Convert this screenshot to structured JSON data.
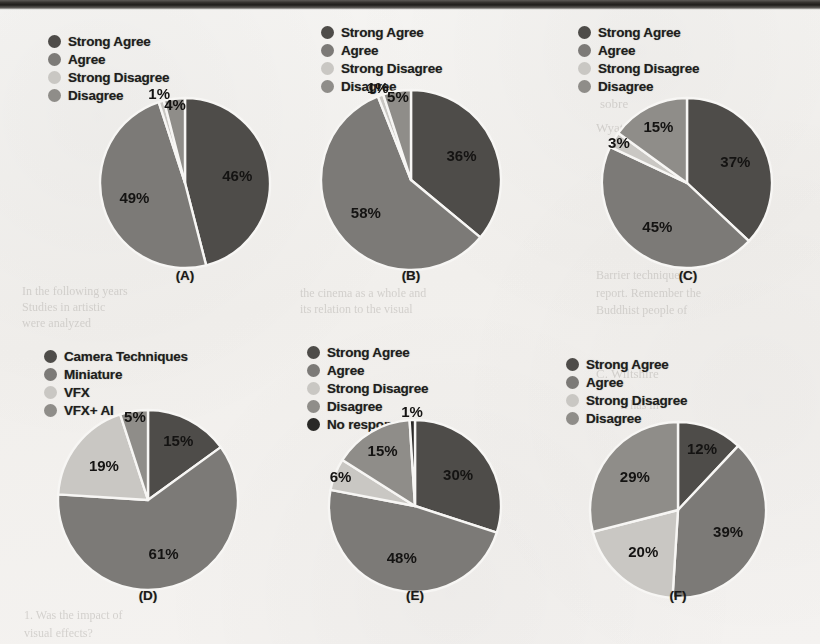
{
  "page": {
    "background_color": "#f3f2f0",
    "scan_edge_color": "#1e1c1a",
    "ghost_text": [
      {
        "text": "sobre",
        "x": 600,
        "y": 96,
        "size": 13
      },
      {
        "text": "Wyatt",
        "x": 596,
        "y": 120,
        "size": 13
      },
      {
        "text": "Barrier techniques",
        "x": 596,
        "y": 268,
        "size": 12
      },
      {
        "text": "report. Remember the",
        "x": 596,
        "y": 286,
        "size": 12
      },
      {
        "text": "Buddhist people of",
        "x": 596,
        "y": 303,
        "size": 12
      },
      {
        "text": "In the following years",
        "x": 22,
        "y": 284,
        "size": 12
      },
      {
        "text": "Studies in artistic",
        "x": 22,
        "y": 300,
        "size": 12
      },
      {
        "text": "were analyzed",
        "x": 22,
        "y": 316,
        "size": 12
      },
      {
        "text": "the cinema as a whole and",
        "x": 300,
        "y": 286,
        "size": 12
      },
      {
        "text": "its relation to the visual",
        "x": 300,
        "y": 302,
        "size": 12
      },
      {
        "text": "1. Was the impact of",
        "x": 24,
        "y": 608,
        "size": 12
      },
      {
        "text": "visual effects?",
        "x": 24,
        "y": 626,
        "size": 12
      },
      {
        "text": "C. Wiltshire",
        "x": 596,
        "y": 366,
        "size": 13
      },
      {
        "text": "It has in",
        "x": 620,
        "y": 398,
        "size": 12
      }
    ]
  },
  "palette": {
    "strong_agree": "#4e4c49",
    "agree": "#7c7a77",
    "strong_disagree": "#c9c7c3",
    "disagree": "#8f8d89",
    "no_response": "#2a2927",
    "camera_techniques": "#4e4c49",
    "miniature": "#7c7a77",
    "vfx": "#c9c7c3",
    "vfx_ai": "#8f8d89",
    "slice_divider": "#f7f6f4"
  },
  "charts": [
    {
      "id": "chart-a",
      "caption": "(A)",
      "legend": [
        {
          "label": "Strong Agree",
          "color": "#4e4c49"
        },
        {
          "label": "Agree",
          "color": "#7c7a77"
        },
        {
          "label": "Strong Disagree",
          "color": "#c9c7c3"
        },
        {
          "label": "Disagree",
          "color": "#8f8d89"
        }
      ],
      "chart_data": {
        "type": "pie",
        "title": "(A)",
        "categories": [
          "Strong Agree",
          "Agree",
          "Strong Disagree",
          "Disagree"
        ],
        "values": [
          46,
          49,
          1,
          4
        ],
        "value_labels": [
          "46%",
          "49%",
          "1%",
          "4%"
        ],
        "unit": "percent",
        "total": 100,
        "start_angle": 0,
        "legend_position": "top-left"
      }
    },
    {
      "id": "chart-b",
      "caption": "(B)",
      "legend": [
        {
          "label": "Strong Agree",
          "color": "#4e4c49"
        },
        {
          "label": "Agree",
          "color": "#7c7a77"
        },
        {
          "label": "Strong Disagree",
          "color": "#c9c7c3"
        },
        {
          "label": "Disagree",
          "color": "#8f8d89"
        }
      ],
      "chart_data": {
        "type": "pie",
        "title": "(B)",
        "categories": [
          "Strong Agree",
          "Agree",
          "Strong Disagree",
          "Disagree"
        ],
        "values": [
          36,
          58,
          1,
          5
        ],
        "value_labels": [
          "36%",
          "58%",
          "1%",
          "5%"
        ],
        "unit": "percent",
        "total": 100,
        "start_angle": 0,
        "legend_position": "top-left"
      }
    },
    {
      "id": "chart-c",
      "caption": "(C)",
      "legend": [
        {
          "label": "Strong Agree",
          "color": "#4e4c49"
        },
        {
          "label": "Agree",
          "color": "#7c7a77"
        },
        {
          "label": "Strong Disagree",
          "color": "#c9c7c3"
        },
        {
          "label": "Disagree",
          "color": "#8f8d89"
        }
      ],
      "chart_data": {
        "type": "pie",
        "title": "(C)",
        "categories": [
          "Strong Agree",
          "Agree",
          "Strong Disagree",
          "Disagree"
        ],
        "values": [
          37,
          45,
          3,
          15
        ],
        "value_labels": [
          "37%",
          "45%",
          "3%",
          "15%"
        ],
        "unit": "percent",
        "total": 100,
        "start_angle": 0,
        "legend_position": "top-left"
      }
    },
    {
      "id": "chart-d",
      "caption": "(D)",
      "legend": [
        {
          "label": "Camera Techniques",
          "color": "#4e4c49"
        },
        {
          "label": "Miniature",
          "color": "#7c7a77"
        },
        {
          "label": "VFX",
          "color": "#c9c7c3"
        },
        {
          "label": "VFX+ AI",
          "color": "#8f8d89"
        }
      ],
      "chart_data": {
        "type": "pie",
        "title": "(D)",
        "categories": [
          "Camera Techniques",
          "Miniature",
          "VFX",
          "VFX+ AI"
        ],
        "values": [
          15,
          61,
          19,
          5
        ],
        "value_labels": [
          "15%",
          "61%",
          "19%",
          "5%"
        ],
        "unit": "percent",
        "total": 100,
        "start_angle": 0,
        "legend_position": "top-left"
      }
    },
    {
      "id": "chart-e",
      "caption": "(E)",
      "legend": [
        {
          "label": "Strong Agree",
          "color": "#4e4c49"
        },
        {
          "label": "Agree",
          "color": "#7c7a77"
        },
        {
          "label": "Strong Disagree",
          "color": "#c9c7c3"
        },
        {
          "label": "Disagree",
          "color": "#8f8d89"
        },
        {
          "label": "No response",
          "color": "#2a2927"
        }
      ],
      "chart_data": {
        "type": "pie",
        "title": "(E)",
        "categories": [
          "Strong Agree",
          "Agree",
          "Strong Disagree",
          "Disagree",
          "No response"
        ],
        "values": [
          30,
          48,
          6,
          15,
          1
        ],
        "value_labels": [
          "30%",
          "48%",
          "6%",
          "15%",
          "1%"
        ],
        "unit": "percent",
        "total": 100,
        "start_angle": 0,
        "legend_position": "top-left"
      }
    },
    {
      "id": "chart-f",
      "caption": "(F)",
      "legend": [
        {
          "label": "Strong Agree",
          "color": "#4e4c49"
        },
        {
          "label": "Agree",
          "color": "#7c7a77"
        },
        {
          "label": "Strong Disagree",
          "color": "#c9c7c3"
        },
        {
          "label": "Disagree",
          "color": "#8f8d89"
        }
      ],
      "chart_data": {
        "type": "pie",
        "title": "(F)",
        "categories": [
          "Strong Agree",
          "Agree",
          "Strong Disagree",
          "Disagree"
        ],
        "values": [
          12,
          39,
          20,
          29
        ],
        "value_labels": [
          "12%",
          "39%",
          "20%",
          "29%"
        ],
        "unit": "percent",
        "total": 100,
        "start_angle": 0,
        "legend_position": "top-left"
      }
    }
  ],
  "layout": {
    "cells": [
      {
        "legend_left": 48,
        "legend_top": 33,
        "pie_left": 100,
        "pie_top": 98,
        "pie_size": 170,
        "caption_left": 155,
        "caption_top": 268
      },
      {
        "legend_left": 48,
        "legend_top": 24,
        "pie_left": 48,
        "pie_top": 90,
        "pie_size": 180,
        "caption_left": 108,
        "caption_top": 268
      },
      {
        "legend_left": 32,
        "legend_top": 24,
        "pie_left": 56,
        "pie_top": 98,
        "pie_size": 170,
        "caption_left": 112,
        "caption_top": 268
      },
      {
        "legend_left": 44,
        "legend_top": 26,
        "pie_left": 58,
        "pie_top": 88,
        "pie_size": 180,
        "caption_left": 118,
        "caption_top": 588
      },
      {
        "legend_left": 34,
        "legend_top": 22,
        "pie_left": 56,
        "pie_top": 98,
        "pie_size": 172,
        "caption_left": 112,
        "caption_top": 588
      },
      {
        "legend_left": 20,
        "legend_top": 34,
        "pie_left": 44,
        "pie_top": 100,
        "pie_size": 176,
        "caption_left": 102,
        "caption_top": 588
      }
    ]
  }
}
